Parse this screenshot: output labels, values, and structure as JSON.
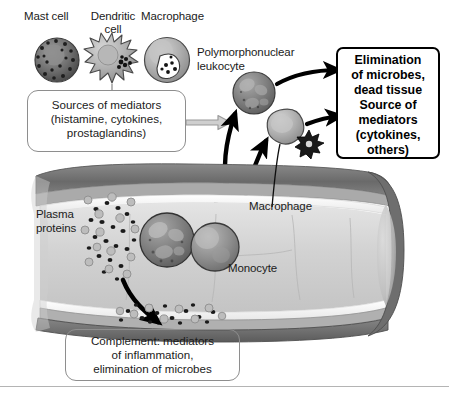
{
  "figure": {
    "background_color": "#ffffff"
  },
  "cell_labels": {
    "mast_cell": "Mast cell",
    "dendritic_cell_line1": "Dendritic",
    "dendritic_cell_line2": "cell",
    "macrophage_top": "Macrophage",
    "pmn_line1": "Polymorphonuclear",
    "pmn_line2": "leukocyte",
    "macrophage_vessel": "Macrophage",
    "monocyte": "Monocyte",
    "plasma_line1": "Plasma",
    "plasma_line2": "proteins"
  },
  "sources_box": {
    "line1": "Sources of mediators",
    "line2": "(histamine, cytokines,",
    "line3": "prostaglandins)"
  },
  "complement_box": {
    "line1": "Complement: mediators",
    "line2": "of inflammation,",
    "line3": "elimination of microbes"
  },
  "outcome_box": {
    "line1": "Elimination",
    "line2": "of microbes,",
    "line3": "dead tissue",
    "line4": "Source of",
    "line5": "mediators",
    "line6": "(cytokines,",
    "line7": "others)"
  },
  "colors": {
    "ink": "#1b1b1b",
    "box_stroke": "#8e8e8e",
    "hard_stroke": "#000000",
    "gray_arrow": "#a8a8a8",
    "vessel_wall_dark": "#6f6f6f",
    "vessel_wall_mid": "#9a9a9a",
    "vessel_lumen": "#d8d8d8",
    "cell_fill": "#a9a9a9",
    "divider": "#b4b4b4"
  }
}
